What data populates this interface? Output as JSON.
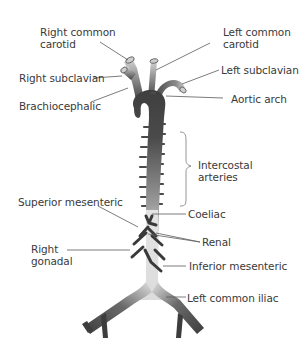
{
  "diagram": {
    "labels": {
      "right_common_carotid": "Right common\ncarotid",
      "left_common_carotid": "Left common\ncarotid",
      "right_subclavian": "Right subclavian",
      "left_subclavian": "Left subclavian",
      "brachiocephalic": "Brachiocephalic",
      "aortic_arch": "Aortic arch",
      "intercostal_arteries": "Intercostal\narteries",
      "superior_mesenteric": "Superior mesenteric",
      "coeliac": "Coeliac",
      "renal": "Renal",
      "right_gonadal": "Right\ngonadal",
      "inferior_mesenteric": "Inferior mesenteric",
      "left_common_iliac": "Left common iliac"
    },
    "colors": {
      "vessel_dark": "#3d3d3d",
      "vessel_light": "#e2e2e2",
      "leader_line": "#555555",
      "text": "#3a3a3a"
    }
  }
}
